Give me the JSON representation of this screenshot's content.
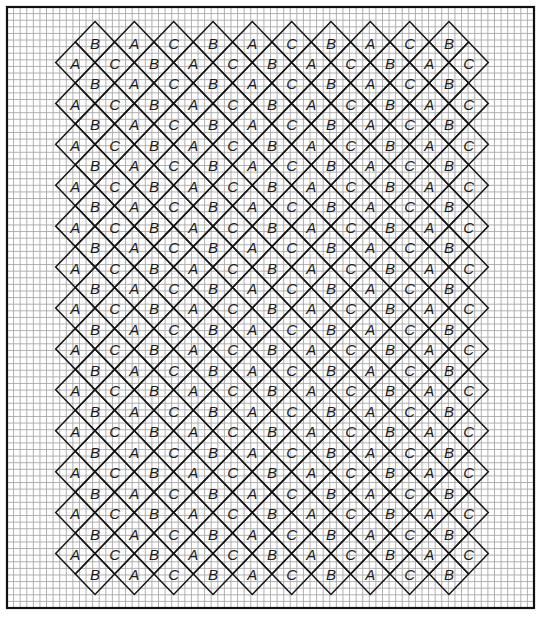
{
  "diagram": {
    "title": "",
    "pattern": {
      "offset_row_letters": [
        "B",
        "A",
        "C",
        "B",
        "A",
        "C",
        "B",
        "A",
        "C",
        "B"
      ],
      "full_row_letters": [
        "A",
        "C",
        "B",
        "A",
        "C",
        "B",
        "A",
        "C",
        "B",
        "A",
        "C"
      ],
      "offset_row_count": 14,
      "full_row_count": 13,
      "row_order": "alternating, starting and ending with offset rows"
    },
    "colors": {
      "grid": "#a8a8a8",
      "frame": "#111111",
      "diamond_outline": "#141414",
      "label": "#1a1a1a",
      "background": "#ffffff"
    }
  }
}
